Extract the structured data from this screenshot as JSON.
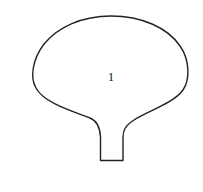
{
  "diagram": {
    "shape": "flask-outline",
    "region_label": "1",
    "stroke_color": "#222222",
    "background": "#ffffff"
  }
}
